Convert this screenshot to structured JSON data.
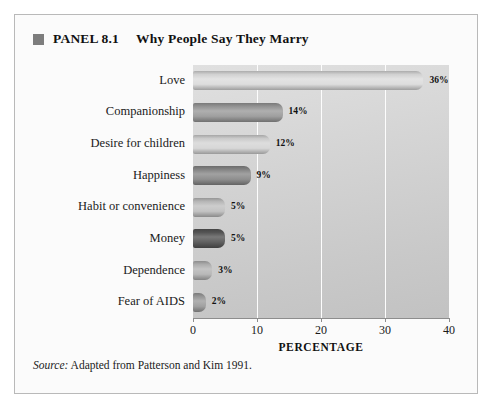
{
  "panel": {
    "bullet_icon": "filled-square-icon",
    "label": "PANEL 8.1",
    "heading": "Why People Say They Marry"
  },
  "source": {
    "prefix": "Source:",
    "text": " Adapted from Patterson and Kim 1991."
  },
  "chart_data": {
    "type": "bar",
    "orientation": "horizontal",
    "title": "Why People Say They Marry",
    "xlabel": "PERCENTAGE",
    "ylabel": "",
    "xlim": [
      0,
      40
    ],
    "xticks": [
      "0",
      "10",
      "20",
      "30",
      "40"
    ],
    "xtick_values": [
      0,
      10,
      20,
      30,
      40
    ],
    "grid": "vertical-white-gridlines",
    "legend": "none",
    "categories": [
      "Love",
      "Companionship",
      "Desire for children",
      "Happiness",
      "Habit or convenience",
      "Money",
      "Dependence",
      "Fear of AIDS"
    ],
    "values": [
      36,
      14,
      12,
      9,
      5,
      5,
      3,
      2
    ],
    "data_labels": [
      "36%",
      "14%",
      "12%",
      "9%",
      "5%",
      "5%",
      "3%",
      "2%"
    ],
    "bar_colors": [
      "#dcdcdc",
      "#9b9b9b",
      "#d5d5d5",
      "#8a8a8a",
      "#c0c0c0",
      "#585858",
      "#b5b5b5",
      "#9d9d9d"
    ]
  },
  "colors": {
    "frame_border": "#b9b9b9",
    "page_background": "#ffffff",
    "figure_background": "#fbfbfb",
    "plot_background": "#d2d2d2",
    "gridline": "#fdfdfd",
    "axis": "#8d8d8d",
    "text": "#111111",
    "bullet": "#7d7d7d"
  }
}
